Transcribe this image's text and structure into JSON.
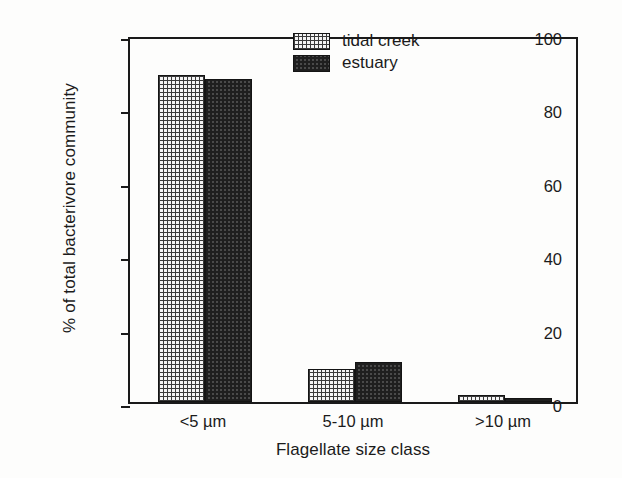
{
  "chart_data": {
    "type": "bar",
    "title": "",
    "xlabel": "Flagellate size class",
    "ylabel": "% of total bacterivore community",
    "categories": [
      "<5 µm",
      "5-10 µm",
      ">10 µm"
    ],
    "series": [
      {
        "name": "tidal creek",
        "values": [
          89,
          9,
          2
        ],
        "pattern": "light-cross-hatch"
      },
      {
        "name": "estuary",
        "values": [
          88,
          11,
          1
        ],
        "pattern": "dark-checkerboard"
      }
    ],
    "ylim": [
      0,
      100
    ],
    "yticks": [
      0,
      20,
      40,
      60,
      80,
      100
    ],
    "ytick_labels": [
      "0",
      "20",
      "40",
      "60",
      "80",
      "100"
    ],
    "grid": false,
    "legend_position": "top-right-inside",
    "frame": "full-box",
    "tick_direction": "outward",
    "colors": {
      "axis": "#1a1a1a",
      "text": "#1b1b1b",
      "background": "#fdfdfc",
      "tidal_creek_fill": "#f4f4f4",
      "estuary_fill": "#4a4a4a"
    }
  }
}
